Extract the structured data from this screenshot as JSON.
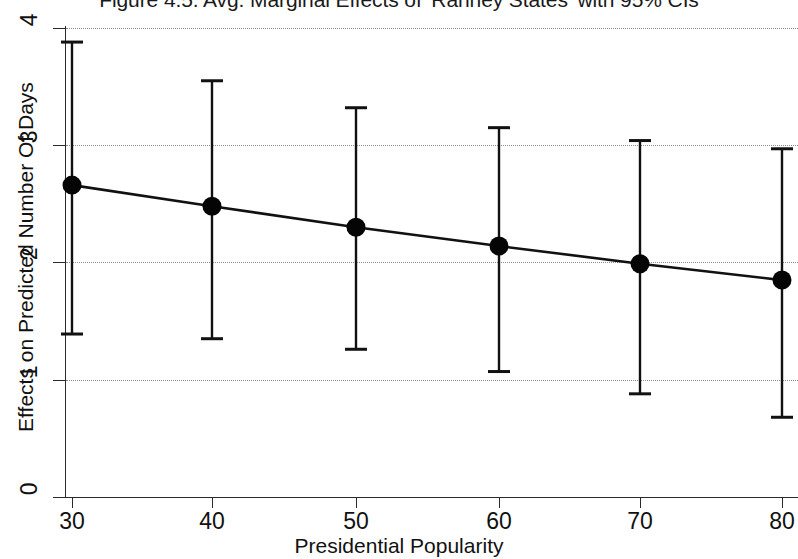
{
  "chart_data": {
    "type": "scatter",
    "title": "Figure 4.5. Avg. Marginal Effects of 'Ranney States' with 95% CIs",
    "xlabel": "Presidential Popularity",
    "ylabel": "Effects on Predicted Number Of Days",
    "xlim": [
      25,
      85
    ],
    "ylim": [
      0,
      4
    ],
    "xticks": [
      30,
      40,
      50,
      60,
      70,
      80
    ],
    "xtick_labels": [
      "30",
      "40",
      "50",
      "60",
      "70",
      "80"
    ],
    "yticks": [
      0,
      1,
      2,
      3,
      4
    ],
    "ytick_labels": [
      "0",
      "1",
      "2",
      "3",
      "4"
    ],
    "grid": "horizontal-dotted",
    "legend": "none",
    "x": [
      30,
      40,
      50,
      60,
      70,
      80
    ],
    "values": [
      2.66,
      2.48,
      2.3,
      2.14,
      1.99,
      1.85
    ],
    "ci_lower": [
      1.39,
      1.35,
      1.26,
      1.07,
      0.88,
      0.68
    ],
    "ci_upper": [
      3.88,
      3.55,
      3.32,
      3.15,
      3.04,
      2.97
    ],
    "series": [
      {
        "name": "Avg. Marginal Effect",
        "values": [
          2.66,
          2.48,
          2.3,
          2.14,
          1.99,
          1.85
        ],
        "ci_lower": [
          1.39,
          1.35,
          1.26,
          1.07,
          0.88,
          0.68
        ],
        "ci_upper": [
          3.88,
          3.55,
          3.32,
          3.15,
          3.04,
          2.97
        ]
      }
    ],
    "marker_color": "#050505",
    "line_color": "#111111",
    "grid_color": "#8d8d8d"
  },
  "axes": {
    "y_title": "Effects on Predicted Number Of Days",
    "x_title": "Presidential Popularity",
    "y_labels": [
      "4",
      "3",
      "2",
      "1",
      "0"
    ],
    "x_labels": [
      "30",
      "40",
      "50",
      "60",
      "70",
      "80"
    ]
  },
  "header": {
    "title": "Figure 4.5. Avg. Marginal Effects of 'Ranney States' with 95% CIs"
  }
}
